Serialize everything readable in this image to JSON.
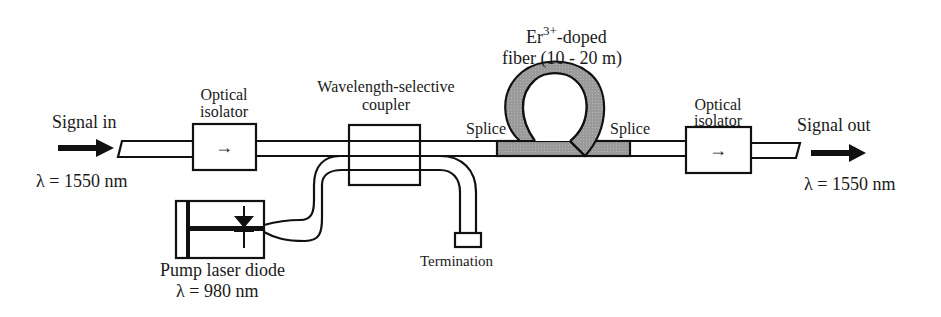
{
  "diagram": {
    "colors": {
      "line": "#111111",
      "doped_fiber_fill": "#9a9a9a",
      "background": "#ffffff"
    },
    "labels": {
      "signal_in": "Signal in",
      "signal_in_wavelength": "λ = 1550 nm",
      "isolator1_line1": "Optical",
      "isolator1_line2": "isolator",
      "isolator1_symbol": "→",
      "coupler_line1": "Wavelength-selective",
      "coupler_line2": "coupler",
      "doped_fiber_base": "Er",
      "doped_fiber_sup": "3+",
      "doped_fiber_rest": "-doped",
      "doped_fiber_line2": "fiber (10 - 20 m)",
      "splice_left": "Splice",
      "splice_right": "Splice",
      "isolator2_line1": "Optical",
      "isolator2_line2": "isolator",
      "isolator2_symbol": "→",
      "signal_out": "Signal out",
      "signal_out_wavelength": "λ = 1550 nm",
      "pump_line1": "Pump laser diode",
      "pump_line2": "λ = 980 nm",
      "termination": "Termination"
    },
    "components": [
      {
        "id": "input-fiber",
        "type": "fiber"
      },
      {
        "id": "optical-isolator-1",
        "type": "isolator"
      },
      {
        "id": "wavelength-selective-coupler",
        "type": "coupler"
      },
      {
        "id": "pump-laser-diode",
        "type": "laser",
        "wavelength_nm": 980
      },
      {
        "id": "termination",
        "type": "terminator"
      },
      {
        "id": "er-doped-fiber",
        "type": "doped-fiber-loop",
        "length": "10 - 20 m"
      },
      {
        "id": "optical-isolator-2",
        "type": "isolator"
      },
      {
        "id": "output-fiber",
        "type": "fiber"
      }
    ]
  }
}
